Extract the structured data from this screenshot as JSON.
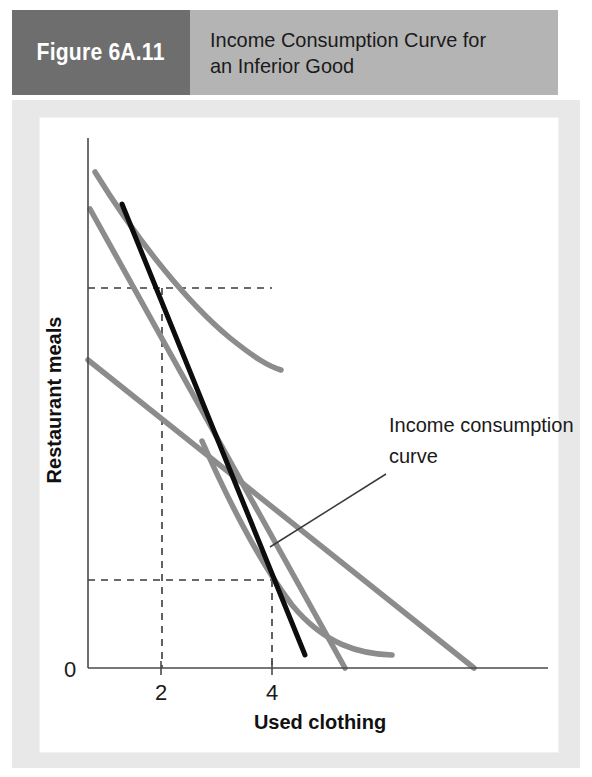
{
  "header": {
    "figure_number": "Figure 6A.11",
    "title": "Income Consumption Curve for\nan Inferior Good",
    "tab_color": "#6e6e6e",
    "band_color": "#b4b4b4",
    "title_color": "#1a1a1a"
  },
  "chart_data": {
    "type": "line",
    "title": "Income Consumption Curve for an Inferior Good",
    "xlabel": "Used clothing",
    "ylabel": "Restaurant meals",
    "origin_label": "0",
    "grid": false,
    "legend": "none",
    "xticks": [
      "2",
      "4"
    ],
    "xtick_values": [
      2,
      4
    ],
    "yticks": [],
    "colors": {
      "indifference_curve": "#8c8c8c",
      "budget_line": "#8c8c8c",
      "income_consumption_curve": "#0d0d0d",
      "axis": "#4a4a4a",
      "dashed_guide": "#3a3a3a"
    },
    "annotations": [
      {
        "name": "income-consumption-curve-label",
        "line1": "Income consumption",
        "line2": "curve",
        "leader_from_x": 270,
        "leader_from_y": 547,
        "leader_to_x": 386,
        "leader_to_y": 474
      }
    ],
    "series": [
      {
        "name": "Indifference curve U2 (higher income)",
        "kind": "indifference_curve",
        "color": "#8c8c8c",
        "path": "M 95,172 C 140,245 190,305 230,338 C 255,358 268,366 281,370"
      },
      {
        "name": "Indifference curve U1 (lower income)",
        "kind": "indifference_curve",
        "color": "#8c8c8c",
        "path": "M 202,441 C 228,500 258,560 292,605 C 325,645 360,654 392,655"
      },
      {
        "name": "Budget line B2 (higher income)",
        "kind": "budget_line",
        "color": "#8c8c8c",
        "path": "M 88,360 L 474,668"
      },
      {
        "name": "Budget line B1 (lower income)",
        "kind": "budget_line",
        "color": "#8c8c8c",
        "path": "M 90,209 L 345,668"
      },
      {
        "name": "Income consumption curve",
        "kind": "income_consumption_curve",
        "color": "#0d0d0d",
        "path": "M 122,204 L 305,655"
      }
    ],
    "tangency_points": [
      {
        "name": "low-income-bundle",
        "x": 4,
        "y_pixel": 580,
        "x_pixel": 272
      },
      {
        "name": "high-income-bundle",
        "x": 2,
        "y_pixel": 288,
        "x_pixel": 162
      }
    ],
    "guides": [
      {
        "name": "dashed-horizontal-upper",
        "from": [
          88,
          288
        ],
        "to": [
          272,
          288
        ]
      },
      {
        "name": "dashed-vertical-at-2",
        "from": [
          162,
          288
        ],
        "to": [
          162,
          668
        ]
      },
      {
        "name": "dashed-horizontal-lower",
        "from": [
          88,
          580
        ],
        "to": [
          272,
          580
        ]
      },
      {
        "name": "dashed-vertical-at-4",
        "from": [
          272,
          580
        ],
        "to": [
          272,
          668
        ]
      }
    ],
    "axes": {
      "y_axis": {
        "from": [
          88,
          138
        ],
        "to": [
          88,
          668
        ]
      },
      "x_axis": {
        "from": [
          88,
          668
        ],
        "to": [
          548,
          668
        ]
      }
    }
  }
}
